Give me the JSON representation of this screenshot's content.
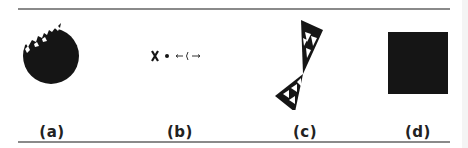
{
  "figure": {
    "panels": [
      {
        "label": "(a)",
        "description": "dark disk with fractal notch at top-left"
      },
      {
        "label": "(b)",
        "description": "sparse points: X, dot, and arrow-like marks"
      },
      {
        "label": "(c)",
        "description": "two Sierpinski-like triangles joined at a point"
      },
      {
        "label": "(d)",
        "description": "solid filled square"
      }
    ],
    "panel_b_glyphs": "X • ⟵‹⟶"
  },
  "colors": {
    "fill": "#151515",
    "rule": "#8a8a8a",
    "background": "#ffffff"
  }
}
